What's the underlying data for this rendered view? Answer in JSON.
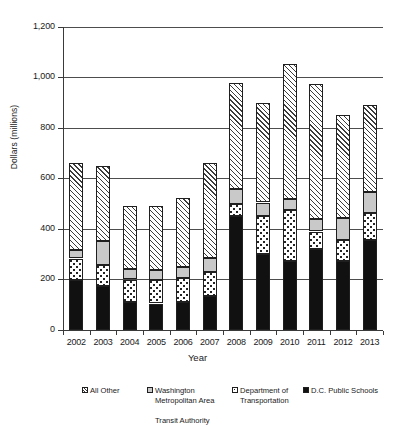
{
  "chart_data": {
    "type": "bar",
    "subtype": "stacked",
    "title": "",
    "xlabel": "Year",
    "ylabel": "Dollars (millions)",
    "categories": [
      "2002",
      "2003",
      "2004",
      "2005",
      "2006",
      "2007",
      "2008",
      "2009",
      "2010",
      "2011",
      "2012",
      "2013"
    ],
    "ylim": [
      0,
      1200
    ],
    "yticks": [
      0,
      200,
      400,
      600,
      800,
      1000,
      1200
    ],
    "ytick_labels": [
      "0",
      "200",
      "400",
      "600",
      "800",
      "1,000",
      "1,200"
    ],
    "grid": true,
    "legend_position": "bottom",
    "series": [
      {
        "name": "D.C. Public Schools",
        "pattern": "solid-black",
        "values": [
          198,
          173,
          110,
          105,
          112,
          135,
          450,
          300,
          275,
          320,
          272,
          355
        ]
      },
      {
        "name": "Department of Transportation",
        "pattern": "dotted",
        "values": [
          85,
          85,
          90,
          92,
          95,
          95,
          50,
          150,
          200,
          70,
          85,
          110
        ]
      },
      {
        "name": "Washington Metropolitan Area Transit Authority",
        "pattern": "solid-gray",
        "values": [
          35,
          95,
          42,
          40,
          42,
          55,
          60,
          55,
          45,
          50,
          85,
          80
        ]
      },
      {
        "name": "All Other",
        "pattern": "diagonal-hatch",
        "values": [
          345,
          297,
          248,
          253,
          272,
          375,
          420,
          395,
          535,
          535,
          408,
          345
        ]
      }
    ],
    "totals": [
      663,
      650,
      490,
      490,
      521,
      660,
      980,
      900,
      1055,
      975,
      850,
      890
    ]
  },
  "axis": {
    "y_title": "Dollars (millions)",
    "x_title": "Year",
    "y_tick_labels": [
      "1,200",
      "1,000",
      "800",
      "600",
      "400",
      "200",
      "0"
    ],
    "x_tick_labels": [
      "2002",
      "2003",
      "2004",
      "2005",
      "2006",
      "2007",
      "2008",
      "2009",
      "2010",
      "2011",
      "2012",
      "2013"
    ]
  },
  "legend": {
    "items": [
      {
        "label": "All Other",
        "label_line2": "",
        "label_line3": "",
        "swatch": "diagonal-hatch-swatch"
      },
      {
        "label": "Washington",
        "label_line2": "Metropolitan Area",
        "label_line3": "Transit Authority",
        "swatch": "gray-swatch"
      },
      {
        "label": "Department of",
        "label_line2": "Transportation",
        "label_line3": "",
        "swatch": "dotted-swatch"
      },
      {
        "label": "D.C. Public Schools",
        "label_line2": "",
        "label_line3": "",
        "swatch": "black-swatch"
      }
    ]
  },
  "colors": {
    "axis": "#3a3a3a",
    "grid": "#4d4d4d",
    "series_black": "#111111",
    "series_gray": "#c9c9c9",
    "series_white": "#ffffff",
    "background": "#ffffff"
  }
}
